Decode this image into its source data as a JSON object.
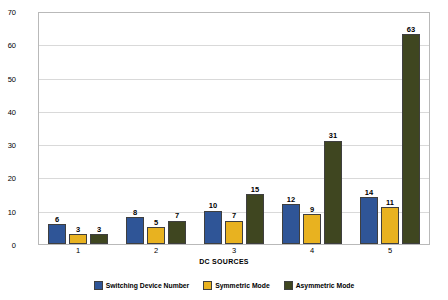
{
  "chart_data": {
    "type": "bar",
    "title": "",
    "xlabel": "DC SOURCES",
    "ylabel": "OUTPUT LEVEL",
    "categories": [
      "1",
      "2",
      "3",
      "4",
      "5"
    ],
    "ylim": [
      0,
      70
    ],
    "yticks": [
      0,
      10,
      20,
      30,
      40,
      50,
      60,
      70
    ],
    "grid": true,
    "legend_position": "bottom",
    "series": [
      {
        "name": "Switching Device Number",
        "color": "#2f5597",
        "values": [
          6,
          8,
          10,
          12,
          14
        ]
      },
      {
        "name": "Symmetric Mode",
        "color": "#e8b220",
        "values": [
          3,
          5,
          7,
          9,
          11
        ]
      },
      {
        "name": "Asymmetric Mode",
        "color": "#3f4620",
        "values": [
          3,
          7,
          15,
          31,
          63
        ]
      }
    ]
  }
}
